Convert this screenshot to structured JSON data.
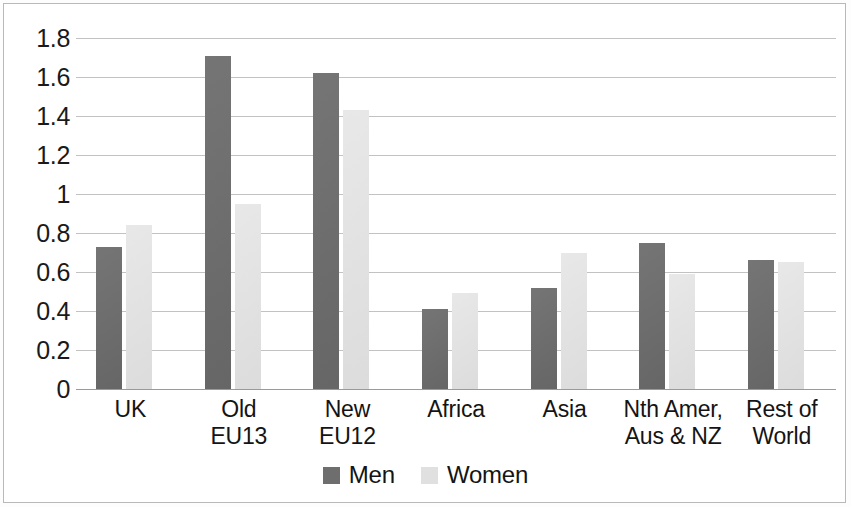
{
  "chart_data": {
    "type": "bar",
    "title": "",
    "subtitle": "",
    "xlabel": "",
    "ylabel": "",
    "ylim": [
      0,
      1.8
    ],
    "grid": true,
    "legend_position": "bottom",
    "ytick_labels": [
      "1.8",
      "1.6",
      "1.4",
      "1.2",
      "1",
      "0.8",
      "0.6",
      "0.4",
      "0.2",
      "0"
    ],
    "ytick_values": [
      1.8,
      1.6,
      1.4,
      1.2,
      1,
      0.8,
      0.6,
      0.4,
      0.2,
      0
    ],
    "categories": [
      {
        "line1": "UK",
        "line2": ""
      },
      {
        "line1": "Old",
        "line2": "EU13"
      },
      {
        "line1": "New",
        "line2": "EU12"
      },
      {
        "line1": "Africa",
        "line2": ""
      },
      {
        "line1": "Asia",
        "line2": ""
      },
      {
        "line1": "Nth Amer,",
        "line2": "Aus & NZ"
      },
      {
        "line1": "Rest of",
        "line2": "World"
      }
    ],
    "series": [
      {
        "name": "Men",
        "color": "#6e6e6e",
        "values": [
          0.73,
          1.71,
          1.62,
          0.41,
          0.52,
          0.75,
          0.66
        ]
      },
      {
        "name": "Women",
        "color": "#e0e0e0",
        "values": [
          0.84,
          0.95,
          1.43,
          0.49,
          0.7,
          0.59,
          0.65
        ]
      }
    ]
  },
  "legend": {
    "items": [
      {
        "label": "Men",
        "swatch": "men-swatch"
      },
      {
        "label": "Women",
        "swatch": "women-swatch"
      }
    ]
  }
}
